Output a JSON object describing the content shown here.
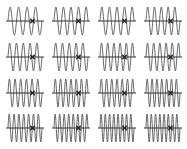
{
  "figure": {
    "rows": 4,
    "cols": 4,
    "stroke_color": "#555555",
    "axis_color": "#333333",
    "marker_color": "#222222",
    "background": "#ffffff"
  },
  "panels": [
    {
      "row": 0,
      "col": 0,
      "cycles": 4.0,
      "x": 8,
      "y": 6,
      "w": 34,
      "h": 30,
      "marker_frac": 0.72
    },
    {
      "row": 0,
      "col": 1,
      "cycles": 4.5,
      "x": 54,
      "y": 6,
      "w": 34,
      "h": 30,
      "marker_frac": 0.72
    },
    {
      "row": 0,
      "col": 2,
      "cycles": 4.5,
      "x": 100,
      "y": 6,
      "w": 34,
      "h": 30,
      "marker_frac": 0.72
    },
    {
      "row": 0,
      "col": 3,
      "cycles": 5.0,
      "x": 146,
      "y": 6,
      "w": 34,
      "h": 30,
      "marker_frac": 0.72
    },
    {
      "row": 1,
      "col": 0,
      "cycles": 5.0,
      "x": 8,
      "y": 42,
      "w": 34,
      "h": 30,
      "marker_frac": 0.72
    },
    {
      "row": 1,
      "col": 1,
      "cycles": 5.0,
      "x": 54,
      "y": 42,
      "w": 34,
      "h": 30,
      "marker_frac": 0.72
    },
    {
      "row": 1,
      "col": 2,
      "cycles": 5.5,
      "x": 100,
      "y": 42,
      "w": 34,
      "h": 30,
      "marker_frac": 0.72
    },
    {
      "row": 1,
      "col": 3,
      "cycles": 5.5,
      "x": 146,
      "y": 42,
      "w": 34,
      "h": 30,
      "marker_frac": 0.72
    },
    {
      "row": 2,
      "col": 0,
      "cycles": 6.0,
      "x": 8,
      "y": 78,
      "w": 34,
      "h": 30,
      "marker_frac": 0.72
    },
    {
      "row": 2,
      "col": 1,
      "cycles": 6.5,
      "x": 54,
      "y": 78,
      "w": 34,
      "h": 30,
      "marker_frac": 0.72
    },
    {
      "row": 2,
      "col": 2,
      "cycles": 6.5,
      "x": 100,
      "y": 78,
      "w": 34,
      "h": 30,
      "marker_frac": 0.72
    },
    {
      "row": 2,
      "col": 3,
      "cycles": 7.0,
      "x": 146,
      "y": 78,
      "w": 34,
      "h": 30,
      "marker_frac": 0.72
    },
    {
      "row": 3,
      "col": 0,
      "cycles": 7.0,
      "x": 8,
      "y": 113,
      "w": 34,
      "h": 30,
      "marker_frac": 0.72
    },
    {
      "row": 3,
      "col": 1,
      "cycles": 7.5,
      "x": 54,
      "y": 113,
      "w": 34,
      "h": 30,
      "marker_frac": 0.72
    },
    {
      "row": 3,
      "col": 2,
      "cycles": 8.0,
      "x": 100,
      "y": 113,
      "w": 34,
      "h": 30,
      "marker_frac": 0.72
    },
    {
      "row": 3,
      "col": 3,
      "cycles": 8.0,
      "x": 146,
      "y": 113,
      "w": 34,
      "h": 30,
      "marker_frac": 0.72
    }
  ]
}
